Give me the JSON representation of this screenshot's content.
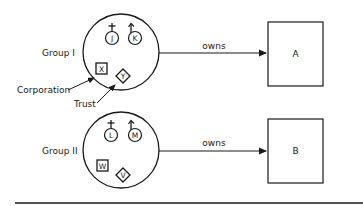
{
  "groups": [
    {
      "label": "Group I",
      "individuals": [
        {
          "letter": "J",
          "symbol": "cross"
        },
        {
          "letter": "K",
          "symbol": "arrow"
        }
      ],
      "entities": [
        {
          "letter": "X",
          "shape": "square",
          "type": "Corporation"
        },
        {
          "letter": "Y",
          "shape": "diamond",
          "type": "Trust"
        }
      ],
      "relation": "owns",
      "target": "A"
    },
    {
      "label": "Group II",
      "individuals": [
        {
          "letter": "L",
          "symbol": "cross"
        },
        {
          "letter": "M",
          "symbol": "arrow"
        }
      ],
      "entities": [
        {
          "letter": "W",
          "shape": "square"
        },
        {
          "letter": "V",
          "shape": "diamond"
        }
      ],
      "relation": "owns",
      "target": "B"
    }
  ],
  "callouts": {
    "corporation": "Corporation",
    "trust": "Trust"
  },
  "colors": {
    "stroke": "#1a1a1a",
    "background": "#ffffff"
  }
}
